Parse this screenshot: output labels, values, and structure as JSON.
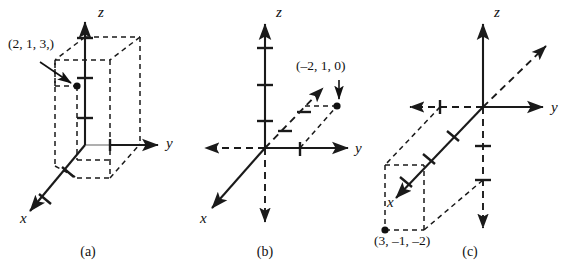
{
  "figure": {
    "background_color": "#ffffff",
    "ink_color": "#1a1a1a",
    "width": 574,
    "height": 279
  },
  "panels": [
    {
      "id": "a",
      "caption": "(a)",
      "caption_x": 88,
      "caption_y": 256,
      "point_label": "(2, 1, 3,)",
      "point_label_x": 8,
      "point_label_y": 48,
      "axes": [
        {
          "name": "x",
          "label": "x",
          "label_x": 20,
          "label_y": 223,
          "style": "solid-arrow"
        },
        {
          "name": "y",
          "label": "y",
          "label_x": 166,
          "label_y": 148,
          "style": "solid-arrow"
        },
        {
          "name": "z",
          "label": "z",
          "label_x": 98,
          "label_y": 17,
          "style": "solid-arrow"
        }
      ],
      "ticks": {
        "x": 1,
        "y": 1,
        "z": 3
      },
      "has_box": true,
      "point": {
        "x": 2,
        "y": 1,
        "z": 3,
        "px": 77,
        "py": 86
      }
    },
    {
      "id": "b",
      "caption": "(b)",
      "caption_x": 265,
      "caption_y": 256,
      "point_label": "(–2, 1, 0)",
      "point_label_x": 296,
      "point_label_y": 70,
      "axes": [
        {
          "name": "x",
          "label": "x",
          "label_x": 200,
          "label_y": 223,
          "style": "solid-arrow-both"
        },
        {
          "name": "y",
          "label": "y",
          "label_x": 355,
          "label_y": 153,
          "style": "solid-arrow"
        },
        {
          "name": "z",
          "label": "z",
          "label_x": 276,
          "label_y": 17,
          "style": "solid-arrow"
        }
      ],
      "ticks": {
        "x": 1,
        "y": 1,
        "z": 3
      },
      "has_box": false,
      "point": {
        "x": -2,
        "y": 1,
        "z": 0,
        "px": 337,
        "py": 106
      }
    },
    {
      "id": "c",
      "caption": "(c)",
      "caption_x": 470,
      "caption_y": 256,
      "point_label": "(3, –1, –2)",
      "point_label_x": 374,
      "point_label_y": 243,
      "axes": [
        {
          "name": "x",
          "label": "x",
          "label_x": 387,
          "label_y": 207,
          "style": "solid-arrow-both"
        },
        {
          "name": "y",
          "label": "y",
          "label_x": 551,
          "label_y": 112,
          "style": "solid-arrow"
        },
        {
          "name": "z",
          "label": "z",
          "label_x": 494,
          "label_y": 17,
          "style": "solid-arrow"
        }
      ],
      "ticks": {
        "x": 3,
        "y": 1,
        "z": 2
      },
      "has_box": true,
      "point": {
        "x": 3,
        "y": -1,
        "z": -2,
        "px": 396,
        "py": 230
      }
    }
  ]
}
